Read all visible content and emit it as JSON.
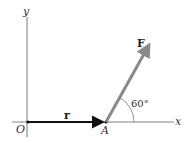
{
  "diagram": {
    "axes": {
      "x_label": "x",
      "y_label": "y",
      "origin_label": "O"
    },
    "point_label": "A",
    "vectors": [
      {
        "name": "r",
        "label": "r",
        "from": "O",
        "to": "A",
        "color": "#111111"
      },
      {
        "name": "F",
        "label": "F",
        "from": "A",
        "color": "#8a8a8a"
      }
    ],
    "angle": {
      "label": "60°",
      "between": [
        "x-axis",
        "F"
      ]
    }
  }
}
